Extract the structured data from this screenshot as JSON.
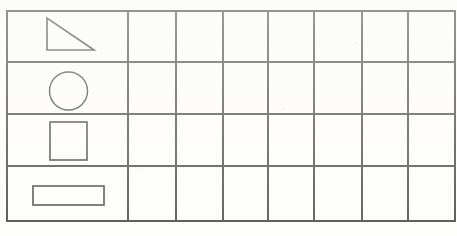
{
  "page": {
    "title": "Shape Tally Grid Worksheet",
    "background_color": "#ffffff",
    "line_color": "#3b3b3b",
    "shape_color": "#3a3a3a",
    "width": 457,
    "height": 236
  },
  "grid": {
    "rows": 4,
    "columns": 8,
    "left": 7,
    "top": 11,
    "right": 455,
    "bottom": 221,
    "column_x": [
      7,
      128,
      176,
      223,
      268,
      314,
      362,
      408,
      455
    ],
    "row_y": [
      11,
      62,
      114,
      166,
      221
    ],
    "first_column_label": "shape column",
    "empty_cell_label": ""
  },
  "shapes": [
    {
      "row": 1,
      "name": "right-triangle",
      "label": "Right triangle",
      "points": "47,18 47,50 94,50",
      "bounds": {
        "x": 47,
        "y": 18,
        "width": 47,
        "height": 32
      }
    },
    {
      "row": 2,
      "name": "circle",
      "label": "Circle",
      "center": {
        "cx": 68.5,
        "cy": 91
      },
      "radius": 19,
      "bounds": {
        "x": 49,
        "y": 72,
        "width": 39,
        "height": 38
      }
    },
    {
      "row": 3,
      "name": "square",
      "label": "Square",
      "bounds": {
        "x": 50,
        "y": 122,
        "width": 37,
        "height": 38
      }
    },
    {
      "row": 4,
      "name": "rectangle",
      "label": "Rectangle",
      "bounds": {
        "x": 33,
        "y": 186,
        "width": 71,
        "height": 19
      }
    }
  ],
  "cells": {
    "row_1": [
      "",
      "",
      "",
      "",
      "",
      "",
      ""
    ],
    "row_2": [
      "",
      "",
      "",
      "",
      "",
      "",
      ""
    ],
    "row_3": [
      "",
      "",
      "",
      "",
      "",
      "",
      ""
    ],
    "row_4": [
      "",
      "",
      "",
      "",
      "",
      "",
      ""
    ]
  }
}
